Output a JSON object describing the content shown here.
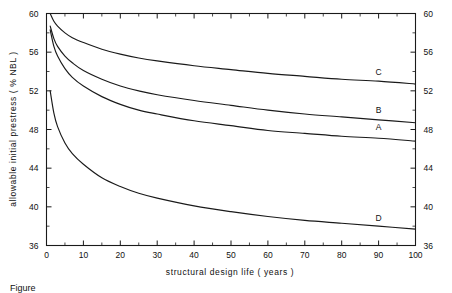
{
  "chart_data": {
    "type": "line",
    "title": "",
    "xlabel": "structural   design   life   ( years )",
    "ylabel": "allowable   initial   prestress    ( % NBL )",
    "xlim": [
      0,
      100
    ],
    "ylim": [
      36,
      60
    ],
    "grid": false,
    "legend_position": "inline-right",
    "xticks": [
      0,
      10,
      20,
      30,
      40,
      50,
      60,
      70,
      80,
      90,
      100
    ],
    "xticklabels": [
      "0",
      "10",
      "20",
      "30",
      "40",
      "50",
      "60",
      "70",
      "80",
      "90",
      "100"
    ],
    "xminor_step": 5,
    "yticks": [
      36,
      40,
      44,
      48,
      52,
      56,
      60
    ],
    "yticklabels": [
      "36",
      "40",
      "44",
      "48",
      "52",
      "56",
      "60"
    ],
    "yminor_step": 2,
    "yticks_right": [
      36,
      40,
      44,
      48,
      52,
      56,
      60
    ],
    "yticklabels_right": [
      "36",
      "40",
      "44",
      "48",
      "52",
      "56",
      "60"
    ],
    "x": [
      1,
      2,
      3,
      5,
      7,
      10,
      15,
      20,
      25,
      30,
      40,
      50,
      60,
      70,
      80,
      90,
      100
    ],
    "series": [
      {
        "name": "C",
        "label": "C",
        "label_x": 90,
        "label_y": 53.6,
        "color": "#1a1a1a",
        "values": [
          60.0,
          59.2,
          58.7,
          58.0,
          57.5,
          57.0,
          56.3,
          55.8,
          55.4,
          55.1,
          54.6,
          54.2,
          53.8,
          53.5,
          53.2,
          53.0,
          52.7
        ]
      },
      {
        "name": "B",
        "label": "B",
        "label_x": 90,
        "label_y": 49.7,
        "color": "#1a1a1a",
        "values": [
          58.7,
          57.4,
          56.6,
          55.6,
          54.9,
          54.1,
          53.2,
          52.5,
          52.0,
          51.6,
          51.0,
          50.5,
          50.0,
          49.6,
          49.3,
          49.0,
          48.7
        ]
      },
      {
        "name": "A",
        "label": "A",
        "label_x": 90,
        "label_y": 48.0,
        "color": "#1a1a1a",
        "values": [
          58.3,
          56.6,
          55.6,
          54.3,
          53.4,
          52.5,
          51.4,
          50.6,
          50.0,
          49.6,
          48.9,
          48.4,
          47.9,
          47.6,
          47.3,
          47.1,
          46.8
        ]
      },
      {
        "name": "D",
        "label": "D",
        "label_x": 90,
        "label_y": 38.5,
        "color": "#1a1a1a",
        "values": [
          52.0,
          49.7,
          48.3,
          46.6,
          45.5,
          44.4,
          43.0,
          42.1,
          41.4,
          40.9,
          40.1,
          39.5,
          39.0,
          38.6,
          38.3,
          38.0,
          37.7
        ]
      }
    ]
  },
  "caption": {
    "text": "Figure"
  }
}
